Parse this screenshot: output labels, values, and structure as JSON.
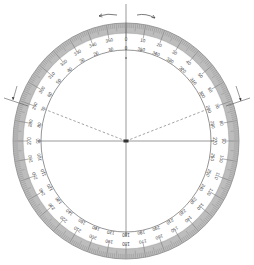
{
  "diagram": {
    "type": "360-degree protractor",
    "center": {
      "x": 126,
      "y": 141
    },
    "outer_radius_x": 113,
    "outer_radius_y": 118,
    "scale_band_width": 10,
    "inner_radius_x": 85,
    "inner_radius_y": 91,
    "colors": {
      "background": "#ffffff",
      "band": "#bdbdbd",
      "band_edge": "#8a8a8a",
      "line": "#555555",
      "text": "#444444"
    },
    "outer_scale": {
      "direction": "clockwise",
      "start_label": "0",
      "labels": [
        "0",
        "10",
        "20",
        "30",
        "40",
        "50",
        "60",
        "70",
        "80",
        "90",
        "100",
        "110",
        "120",
        "130",
        "140",
        "150",
        "160",
        "170",
        "180",
        "190",
        "200",
        "210",
        "220",
        "230",
        "240",
        "250",
        "260",
        "270",
        "280",
        "290",
        "300",
        "310",
        "320",
        "330",
        "340",
        "350"
      ]
    },
    "inner_scale": {
      "direction": "counterclockwise",
      "start_label": "0",
      "labels": [
        "0",
        "350",
        "340",
        "330",
        "320",
        "310",
        "300",
        "290",
        "280",
        "270",
        "260",
        "250",
        "240",
        "230",
        "220",
        "210",
        "200",
        "190",
        "180",
        "170",
        "160",
        "150",
        "140",
        "130",
        "120",
        "110",
        "100",
        "90",
        "80",
        "70",
        "60",
        "50",
        "40",
        "30",
        "20",
        "10"
      ]
    },
    "rotation_arrows": [
      {
        "direction": "counterclockwise",
        "position": "top-left"
      },
      {
        "direction": "clockwise",
        "position": "top-right"
      }
    ],
    "reference_marks": [
      {
        "side": "left",
        "angle_deg": 290
      },
      {
        "side": "right",
        "angle_deg": 70
      }
    ],
    "dashed_lines": [
      {
        "angle_deg": 290
      },
      {
        "angle_deg": 70
      }
    ],
    "axes": {
      "vertical": true,
      "horizontal": true
    }
  }
}
